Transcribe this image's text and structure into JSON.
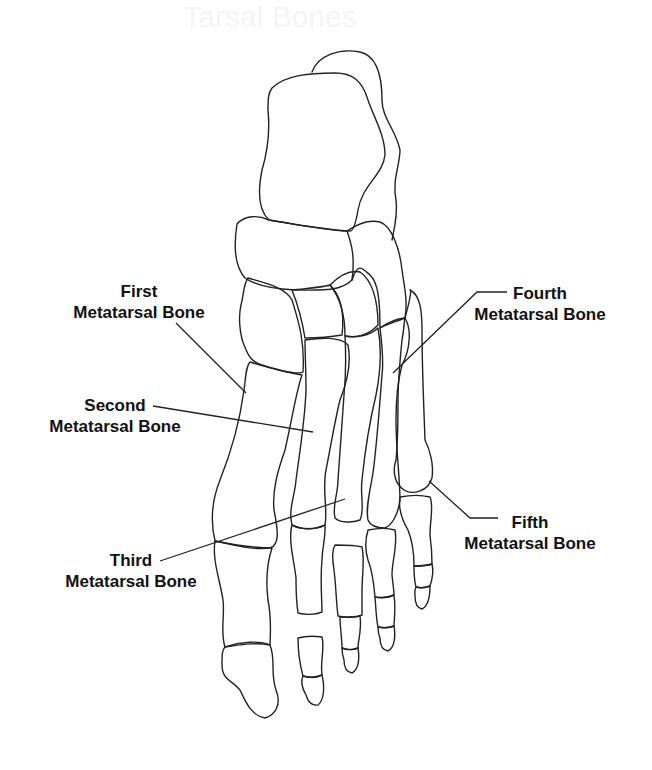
{
  "watermark": "Tarsal Bones",
  "labels": [
    {
      "id": "first",
      "line1": "First",
      "line2": "Metatarsal Bone"
    },
    {
      "id": "second",
      "line1": "Second",
      "line2": "Metatarsal Bone"
    },
    {
      "id": "third",
      "line1": "Third",
      "line2": "Metatarsal Bone"
    },
    {
      "id": "fourth",
      "line1": "Fourth",
      "line2": "Metatarsal Bone"
    },
    {
      "id": "fifth",
      "line1": "Fifth",
      "line2": "Metatarsal Bone"
    }
  ],
  "colors": {
    "stroke": "#222222",
    "background": "#ffffff",
    "text": "#111111"
  }
}
